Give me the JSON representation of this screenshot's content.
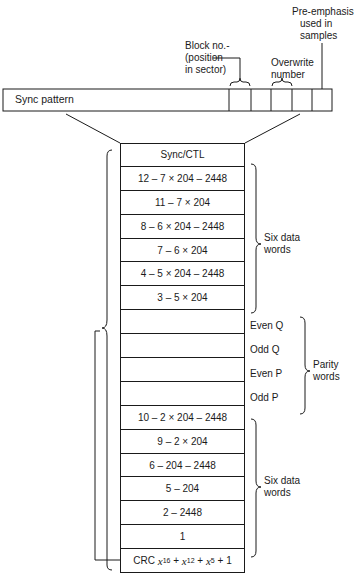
{
  "diagram": {
    "sync_strip": {
      "label": "Sync pattern",
      "cells": 5
    },
    "annotations": {
      "block_no": [
        "Block no.-",
        "(position",
        "in sector)"
      ],
      "overwrite": [
        "Overwrite",
        "number"
      ],
      "pre_emphasis": [
        "Pre-emphasis",
        "used in",
        "samples"
      ]
    },
    "rows": [
      {
        "text": "Sync/CTL"
      },
      {
        "text": "12 – 7 × 204 – 2448"
      },
      {
        "text": "11 – 7 × 204"
      },
      {
        "text": "8 – 6 × 204 – 2448"
      },
      {
        "text": "7 – 6 × 204"
      },
      {
        "text": "4 – 5 × 204 – 2448"
      },
      {
        "text": "3 – 5 × 204"
      },
      {
        "text": ""
      },
      {
        "text": ""
      },
      {
        "text": ""
      },
      {
        "text": ""
      },
      {
        "text": "10 – 2 × 204 – 2448"
      },
      {
        "text": "9 – 2 × 204"
      },
      {
        "text": "6 – 204 – 2448"
      },
      {
        "text": "5 – 204"
      },
      {
        "text": "2 – 2448"
      },
      {
        "text": "1"
      }
    ],
    "crc": {
      "prefix": "CRC",
      "terms": [
        "x",
        "16",
        "x",
        "12",
        "x",
        "5"
      ],
      "suffix": "+ 1"
    },
    "parity_labels": [
      "Even Q",
      "Odd Q",
      "Even P",
      "Odd P"
    ],
    "group_labels": {
      "six_data_words_top": [
        "Six data",
        "words"
      ],
      "parity_words": [
        "Parity",
        "words"
      ],
      "six_data_words_bottom": [
        "Six data",
        "words"
      ]
    }
  }
}
